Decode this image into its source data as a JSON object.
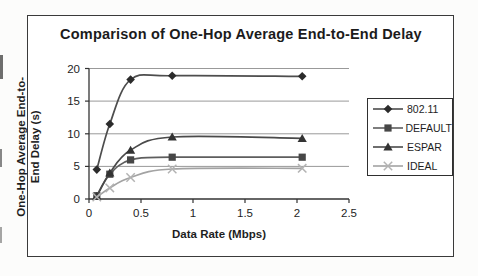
{
  "chart_data": {
    "type": "line",
    "title": "Comparison of One-Hop Average End-to-End Delay",
    "xlabel": "Data Rate (Mbps)",
    "ylabel": "One-Hop Average End-to-End Delay (s)",
    "ylabel_lines": [
      "One-Hop Average End-to-",
      "End Delay (s)"
    ],
    "xlim": [
      0,
      2.5
    ],
    "ylim": [
      0,
      20
    ],
    "xticks": [
      0,
      0.5,
      1,
      1.5,
      2,
      2.5
    ],
    "yticks": [
      0,
      5,
      10,
      15,
      20
    ],
    "grid": "horizontal",
    "legend_position": "right",
    "x": [
      0.075,
      0.2,
      0.4,
      0.8,
      2.05
    ],
    "series": [
      {
        "name": "802.11",
        "marker": "diamond",
        "line_color": "#4d4d4d",
        "marker_color": "#2b2b2b",
        "values": [
          4.5,
          11.5,
          18.3,
          18.9,
          18.8
        ]
      },
      {
        "name": "DEFAULT",
        "marker": "square",
        "line_color": "#5e5e5e",
        "marker_color": "#474747",
        "values": [
          0.5,
          3.8,
          6.0,
          6.4,
          6.4
        ]
      },
      {
        "name": "ESPAR",
        "marker": "triangle",
        "line_color": "#4a4a4a",
        "marker_color": "#333333",
        "values": [
          0.4,
          4.0,
          7.5,
          9.5,
          9.3
        ]
      },
      {
        "name": "IDEAL",
        "marker": "x",
        "line_color": "#a3a3a3",
        "marker_color": "#b3b3b3",
        "values": [
          0.3,
          1.7,
          3.3,
          4.6,
          4.7
        ]
      }
    ],
    "colors": {
      "grid": "#999999",
      "axis": "#333333",
      "text": "#1e1e1e",
      "frame": "#3a3a3a"
    }
  }
}
